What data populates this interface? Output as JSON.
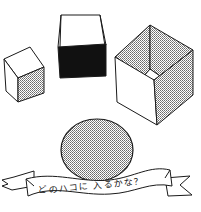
{
  "illustration": {
    "title": "Which box will the disc fit in?",
    "background": "#ffffff",
    "ink_color": "#1a1a1a",
    "tone_color": "#9a9a9a",
    "fill_dark": "#111111",
    "shapes": [
      {
        "id": "small-box",
        "kind": "box",
        "description": "small house-shaped box with dotted right face"
      },
      {
        "id": "black-box",
        "kind": "open-box",
        "description": "open-top box with solid black front face"
      },
      {
        "id": "large-box",
        "kind": "open-box",
        "description": "large open-top cube with dotted inner faces"
      },
      {
        "id": "disc",
        "kind": "disc",
        "description": "dotted round disc"
      }
    ],
    "banner": {
      "text": "どのハコに 入るかな？"
    }
  }
}
